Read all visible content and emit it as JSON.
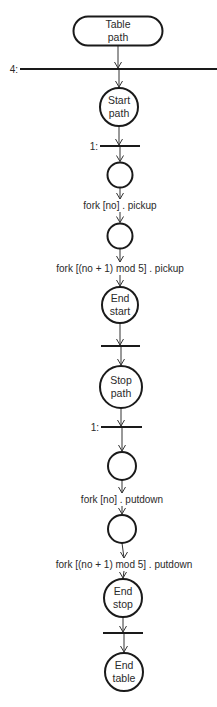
{
  "diagram": {
    "type": "path-expression flow (dining philosophers)",
    "nodes": [
      {
        "id": "table-path",
        "shape": "stadium",
        "lines": [
          "Table",
          "path"
        ]
      },
      {
        "id": "bar-4",
        "shape": "bar",
        "label": "4:"
      },
      {
        "id": "start-path",
        "shape": "circle",
        "lines": [
          "Start",
          "path"
        ]
      },
      {
        "id": "bar-1a",
        "shape": "bar",
        "label": "1:"
      },
      {
        "id": "c1",
        "shape": "circle",
        "lines": []
      },
      {
        "id": "lbl-pickup-no",
        "shape": "label",
        "text": "fork [no] . pickup"
      },
      {
        "id": "c2",
        "shape": "circle",
        "lines": []
      },
      {
        "id": "lbl-pickup-next",
        "shape": "label",
        "text": "fork [(no + 1) mod 5] . pickup"
      },
      {
        "id": "end-start",
        "shape": "circle",
        "lines": [
          "End",
          "start"
        ]
      },
      {
        "id": "bar-b",
        "shape": "bar",
        "label": ""
      },
      {
        "id": "stop-path",
        "shape": "circle",
        "lines": [
          "Stop",
          "path"
        ]
      },
      {
        "id": "bar-1b",
        "shape": "bar",
        "label": "1:"
      },
      {
        "id": "c3",
        "shape": "circle",
        "lines": []
      },
      {
        "id": "lbl-putdown-no",
        "shape": "label",
        "text": "fork [no] . putdown"
      },
      {
        "id": "c4",
        "shape": "circle",
        "lines": []
      },
      {
        "id": "lbl-putdown-next",
        "shape": "label",
        "text": "fork [(no + 1) mod 5] . putdown"
      },
      {
        "id": "end-stop",
        "shape": "circle",
        "lines": [
          "End",
          "stop"
        ]
      },
      {
        "id": "bar-c",
        "shape": "bar",
        "label": ""
      },
      {
        "id": "end-table",
        "shape": "circle",
        "lines": [
          "End",
          "table"
        ]
      }
    ]
  }
}
